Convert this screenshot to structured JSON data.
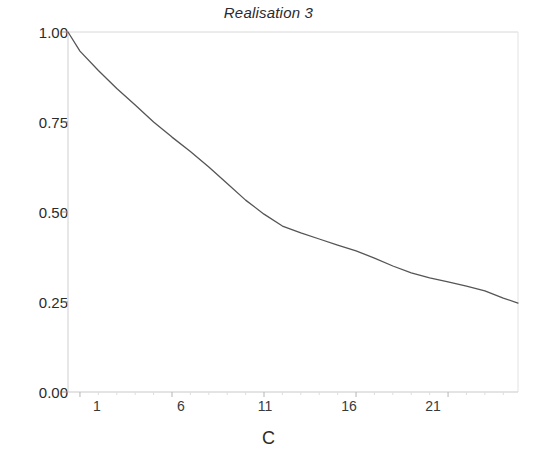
{
  "chart_data": {
    "type": "line",
    "title": "Realisation 3",
    "xlabel": "C",
    "ylabel": "",
    "grid": false,
    "legend": null,
    "xlim": [
      0.35,
      24.8
    ],
    "ylim": [
      0.0,
      1.0
    ],
    "xticks": [
      1,
      6,
      11,
      16,
      21
    ],
    "xtick_labels": [
      "1",
      "6",
      "11",
      "16",
      "21"
    ],
    "yticks": [
      0.0,
      0.25,
      0.5,
      0.75,
      1.0
    ],
    "ytick_labels": [
      "0.00",
      "0.25",
      "0.50",
      "0.75",
      "1.00"
    ],
    "line_color": "#555555",
    "series": [
      {
        "name": "Realisation 3",
        "x": [
          0.35,
          1,
          2,
          3,
          4,
          5,
          6,
          7,
          8,
          9,
          10,
          11,
          12,
          13,
          14,
          15,
          16,
          17,
          18,
          19,
          20,
          21,
          22,
          23,
          24,
          24.8
        ],
        "values": [
          1.0,
          0.947,
          0.893,
          0.843,
          0.797,
          0.75,
          0.708,
          0.668,
          0.625,
          0.579,
          0.533,
          0.494,
          0.461,
          0.442,
          0.425,
          0.408,
          0.392,
          0.372,
          0.35,
          0.331,
          0.317,
          0.306,
          0.294,
          0.281,
          0.261,
          0.247
        ]
      }
    ]
  }
}
